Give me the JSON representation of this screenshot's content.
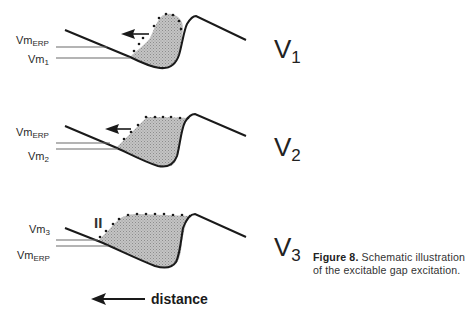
{
  "figure": {
    "panels": [
      {
        "id": "V1",
        "label": "V",
        "label_sub": "1",
        "upper_level_label": "Vm",
        "upper_level_sub": "ERP",
        "lower_level_label": "Vm",
        "lower_level_sub": "1"
      },
      {
        "id": "V2",
        "label": "V",
        "label_sub": "2",
        "upper_level_label": "Vm",
        "upper_level_sub": "ERP",
        "lower_level_label": "Vm",
        "lower_level_sub": "2"
      },
      {
        "id": "V3",
        "label": "V",
        "label_sub": "3",
        "upper_level_label": "Vm",
        "upper_level_sub": "3",
        "lower_level_label": "Vm",
        "lower_level_sub": "ERP",
        "block_marker": "II"
      }
    ],
    "axis": {
      "label": "distance",
      "direction_icon": "left-arrow-icon"
    },
    "caption": {
      "title": "Figure 8.",
      "text": " Schematic illustration of the excitable gap excitation."
    },
    "colors": {
      "line": "#1a1a1a",
      "shade": "#b4b4b4",
      "dots": "#1a1a1a",
      "level_lines": "#6b6b6b"
    }
  }
}
